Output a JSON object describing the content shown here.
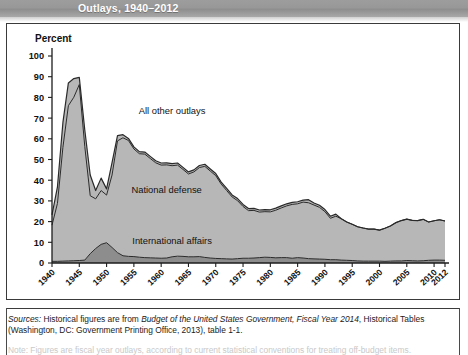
{
  "header": {
    "title": "Outlays, 1940–2012"
  },
  "figure": {
    "axis_title": "Percent"
  },
  "notes": {
    "sources_label": "Sources:",
    "sources_text_1": " Historical figures are from ",
    "sources_italic_1": "Budget of the United States Government, Fiscal Year 2014",
    "sources_text_2": ", Historical Tables (Washington, DC: Government Printing Office, 2013), table 1-1.",
    "note_label": "Note:",
    "note_text": " Figures are fiscal year outlays, according to current statistical conventions for treating off-budget items."
  },
  "colors": {
    "all_other": "#b7b7b7",
    "national_defense": "#b7b7b7",
    "international_affairs": "#8d8d8d",
    "line": "#2a2a2a",
    "header_band": "#9a9a9a",
    "frame": "#3a3a3a"
  },
  "chart_data": {
    "type": "area",
    "title": "Outlays, 1940–2012",
    "xlabel": "",
    "ylabel": "Percent",
    "ylim": [
      0,
      100
    ],
    "xlim": [
      1940,
      2012
    ],
    "grid": false,
    "legend": "inline-annotations",
    "ytick_labels": [
      "0",
      "10",
      "20",
      "30",
      "40",
      "50",
      "60",
      "70",
      "80",
      "90",
      "100"
    ],
    "yticks": [
      0,
      10,
      20,
      30,
      40,
      50,
      60,
      70,
      80,
      90,
      100
    ],
    "xtick_labels": [
      "1940",
      "1945",
      "1950",
      "1955",
      "1960",
      "1965",
      "1970",
      "1975",
      "1980",
      "1985",
      "1990",
      "1995",
      "2000",
      "2005",
      "2010",
      "2012"
    ],
    "xticks": [
      1940,
      1945,
      1950,
      1955,
      1960,
      1965,
      1970,
      1975,
      1980,
      1985,
      1990,
      1995,
      2000,
      2005,
      2010,
      2012
    ],
    "annotations": [
      {
        "text": "All other outlays",
        "x": 1962,
        "y": 72
      },
      {
        "text": "National defense",
        "x": 1961,
        "y": 34
      },
      {
        "text": "International affairs",
        "x": 1962,
        "y": 9
      }
    ],
    "x": [
      1940,
      1941,
      1942,
      1943,
      1944,
      1945,
      1946,
      1947,
      1948,
      1949,
      1950,
      1951,
      1952,
      1953,
      1954,
      1955,
      1956,
      1957,
      1958,
      1959,
      1960,
      1961,
      1962,
      1963,
      1964,
      1965,
      1966,
      1967,
      1968,
      1969,
      1970,
      1971,
      1972,
      1973,
      1974,
      1975,
      1976,
      1977,
      1978,
      1979,
      1980,
      1981,
      1982,
      1983,
      1984,
      1985,
      1986,
      1987,
      1988,
      1989,
      1990,
      1991,
      1992,
      1993,
      1994,
      1995,
      1996,
      1997,
      1998,
      1999,
      2000,
      2001,
      2002,
      2003,
      2004,
      2005,
      2006,
      2007,
      2008,
      2009,
      2010,
      2011,
      2012
    ],
    "series": [
      {
        "name": "International affairs",
        "key": "international_affairs",
        "color": "#8d8d8d",
        "values": [
          0.8,
          0.8,
          0.9,
          1.0,
          1.1,
          1.2,
          1.4,
          4.5,
          7.0,
          9.0,
          9.8,
          7.5,
          5.0,
          3.5,
          3.2,
          3.1,
          2.8,
          2.6,
          2.5,
          2.4,
          2.3,
          2.4,
          3.0,
          3.3,
          3.2,
          3.0,
          3.0,
          3.1,
          2.7,
          2.4,
          2.2,
          2.1,
          2.0,
          1.9,
          2.1,
          2.3,
          2.3,
          2.4,
          2.6,
          2.8,
          2.7,
          2.5,
          2.6,
          2.6,
          2.3,
          2.6,
          2.4,
          2.1,
          2.0,
          1.9,
          1.8,
          1.6,
          1.6,
          1.4,
          1.3,
          1.2,
          1.0,
          0.9,
          0.9,
          0.9,
          0.9,
          0.8,
          0.9,
          1.0,
          1.0,
          1.2,
          1.1,
          1.0,
          1.1,
          1.3,
          1.4,
          1.4,
          1.3
        ]
      },
      {
        "name": "National defense",
        "key": "national_defense",
        "color": "#b7b7b7",
        "values": [
          17.5,
          28.0,
          55.0,
          75.0,
          79.0,
          85.0,
          55.0,
          28.0,
          24.0,
          26.0,
          23.0,
          35.0,
          54.0,
          57.0,
          56.0,
          52.0,
          50.0,
          50.0,
          48.0,
          46.0,
          45.0,
          45.0,
          44.0,
          44.0,
          42.0,
          40.0,
          41.0,
          43.0,
          44.0,
          42.0,
          40.0,
          36.0,
          33.0,
          30.0,
          28.0,
          25.0,
          23.0,
          23.0,
          22.0,
          22.0,
          22.0,
          23.0,
          24.0,
          25.0,
          26.0,
          26.0,
          27.0,
          27.0,
          26.0,
          25.0,
          23.0,
          20.0,
          21.0,
          20.0,
          18.5,
          17.5,
          16.5,
          16.0,
          15.5,
          15.5,
          15.0,
          16.0,
          17.0,
          18.5,
          19.5,
          20.0,
          19.5,
          19.5,
          20.0,
          18.5,
          19.0,
          19.5,
          19.0
        ]
      },
      {
        "name": "All other outlays",
        "key": "all_other",
        "color": "#b7b7b7",
        "values": [
          5.0,
          8.0,
          12.0,
          11.0,
          9.0,
          3.5,
          8.0,
          10.0,
          4.0,
          6.0,
          3.0,
          6.0,
          2.5,
          1.5,
          1.0,
          1.0,
          1.0,
          1.0,
          1.0,
          1.0,
          1.0,
          1.0,
          1.0,
          1.0,
          1.0,
          1.0,
          1.0,
          1.0,
          1.0,
          1.0,
          1.0,
          1.0,
          1.0,
          1.0,
          1.0,
          1.0,
          1.0,
          1.0,
          1.0,
          1.0,
          1.0,
          1.0,
          1.0,
          1.0,
          1.0,
          1.0,
          1.0,
          1.0,
          1.0,
          1.0,
          1.0,
          1.0,
          1.0,
          1.0,
          1.0,
          1.0,
          1.0,
          1.0,
          1.0,
          1.0,
          1.0,
          1.0,
          1.0,
          1.0,
          1.0,
          1.0,
          1.0,
          1.0,
          1.0,
          1.0,
          1.0,
          1.0,
          1.0
        ]
      }
    ],
    "total_outlays_pct": [
      23.3,
      36.8,
      67.9,
      87.0,
      89.1,
      89.7,
      64.4,
      42.5,
      35.0,
      41.0,
      35.8,
      48.5,
      61.5,
      62.0,
      60.2,
      56.1,
      53.8,
      53.6,
      51.5,
      49.4,
      48.3,
      48.4,
      48.0,
      48.3,
      46.2,
      44.0,
      45.0,
      47.1,
      47.7,
      45.4,
      43.2,
      39.1,
      36.0,
      32.9,
      31.1,
      28.3,
      26.3,
      26.4,
      25.6,
      25.8,
      25.7,
      26.5,
      27.6,
      28.6,
      29.3,
      29.6,
      30.4,
      30.6,
      29.0,
      27.9,
      25.8,
      22.6,
      23.6,
      21.4,
      19.8,
      18.7,
      17.5,
      16.9,
      16.4,
      16.4,
      15.9,
      16.8,
      17.9,
      19.5,
      20.5,
      21.2,
      20.6,
      20.5,
      21.1,
      19.8,
      20.4,
      20.9,
      20.3
    ]
  }
}
